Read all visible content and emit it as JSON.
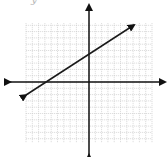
{
  "partial_label": "y",
  "colors": {
    "grid": "#c8c8c8",
    "axis": "#111111",
    "line": "#1a1a1a",
    "background": "#ffffff"
  },
  "chart_data": {
    "type": "line",
    "title": "",
    "xlabel": "",
    "ylabel": "",
    "grid": true,
    "legend": null,
    "xlim": [
      -10,
      10
    ],
    "ylim": [
      -10,
      9
    ],
    "axes": {
      "x_axis_arrows": true,
      "y_axis_arrows": true,
      "tick_labels": false
    },
    "series": [
      {
        "name": "line",
        "arrows_both_ends": true,
        "x": [
          -10,
          7
        ],
        "y": [
          -2,
          9
        ],
        "slope": 0.63,
        "y_intercept": 4.4,
        "x_intercept": -7
      }
    ]
  },
  "layout": {
    "origin_px": [
      89,
      82
    ],
    "unit_px": 6.3,
    "grid_px": {
      "left": 26,
      "right": 152,
      "top": 23,
      "bottom": 143
    },
    "x_axis_px": {
      "left": 10,
      "right": 165
    },
    "y_axis_px": {
      "top": 5,
      "bottom": 155
    },
    "line_px": {
      "x1": 26,
      "y1": 95,
      "x2": 134,
      "y2": 25
    }
  }
}
